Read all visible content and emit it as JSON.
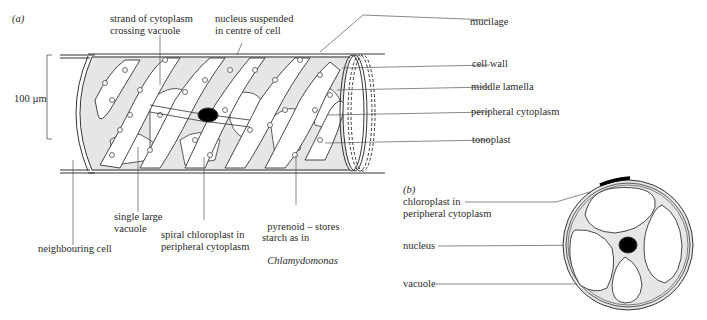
{
  "panel_a": {
    "tag": "(a)",
    "scale_bar": "100 µm",
    "labels": {
      "strand": "strand of cytoplasm\ncrossing vacuole",
      "nucleus_suspended": "nucleus suspended\nin centre of cell",
      "mucilage": "mucilage",
      "cell_wall": "cell wall",
      "middle_lamella": "middle lamella",
      "peripheral_cytoplasm": "peripheral cytoplasm",
      "tonoplast": "tonoplast",
      "single_large_vacuole": "single large\nvacuole",
      "neighbouring_cell": "neighbouring cell",
      "spiral_chloroplast": "spiral chloroplast in\nperipheral cytoplasm",
      "pyrenoid_line1": "pyrenoid – stores\nstarch as in",
      "pyrenoid_genus": "Chlamydomonas"
    }
  },
  "panel_b": {
    "tag": "(b)",
    "labels": {
      "chloroplast": "chloroplast in\nperipheral cytoplasm",
      "nucleus": "nucleus",
      "vacuole": "vacuole"
    }
  },
  "colors": {
    "line": "#333333",
    "cytoplasm": "#e4e4e4",
    "nucleus": "#000000"
  }
}
